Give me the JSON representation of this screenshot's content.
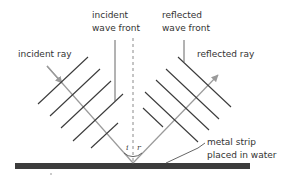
{
  "diagram": {
    "labels": {
      "incident_ray": "incident ray",
      "incident_wave_front_line1": "incident",
      "incident_wave_front_line2": "wave front",
      "reflected_wave_front_line1": "reflected",
      "reflected_wave_front_line2": "wave front",
      "reflected_ray": "reflected ray",
      "metal_strip_line1": "metal strip",
      "metal_strip_line2": "placed in water",
      "angle_incidence": "i",
      "angle_reflection": "r"
    },
    "elements": {
      "incident_wave_fronts_count": 5,
      "reflected_wave_fronts_count": 5,
      "normal": "dashed vertical line",
      "surface": "metal strip"
    },
    "colors": {
      "ray": "#9a9a9a",
      "wave_front": "#3a3a3a",
      "normal": "#8a8a8a",
      "strip": "#3c3c3c",
      "text": "#333333"
    }
  }
}
